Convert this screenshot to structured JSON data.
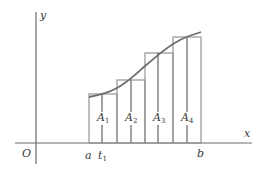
{
  "diagram": {
    "title": "",
    "axes": {
      "x_label": "x",
      "y_label": "y",
      "origin_label": "O"
    },
    "interval": {
      "start_label": "a",
      "end_label": "b",
      "tick_labels": [
        {
          "base": "t",
          "sub": "1"
        }
      ]
    },
    "rectangles": [
      {
        "label_base": "A",
        "label_sub": "1"
      },
      {
        "label_base": "A",
        "label_sub": "2"
      },
      {
        "label_base": "A",
        "label_sub": "3"
      },
      {
        "label_base": "A",
        "label_sub": "4"
      }
    ],
    "colors": {
      "axis": "#6a6a6a",
      "rectangle": "#8a8a8a",
      "curve": "#6e6e6e",
      "text": "#3a3a3a"
    }
  }
}
